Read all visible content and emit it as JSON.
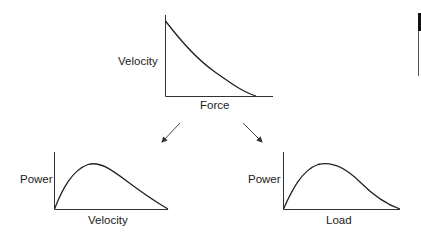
{
  "diagram": {
    "top_chart": {
      "ylabel": "Velocity",
      "xlabel": "Force",
      "curve": "decreasing-concave-up"
    },
    "bottom_left_chart": {
      "ylabel": "Power",
      "xlabel": "Velocity",
      "curve": "rise-peak-fall"
    },
    "bottom_right_chart": {
      "ylabel": "Power",
      "xlabel": "Load",
      "curve": "rise-peak-fall"
    },
    "arrows": [
      {
        "from": "top_chart",
        "to": "bottom_left_chart"
      },
      {
        "from": "top_chart",
        "to": "bottom_right_chart"
      }
    ]
  },
  "colors": {
    "line": "#222222",
    "background": "#ffffff"
  }
}
